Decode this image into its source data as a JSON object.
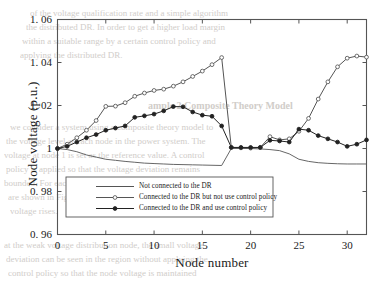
{
  "figure": {
    "background_color": "#ffffff",
    "axis_color": "#555555",
    "text_color": "#1a1a1a"
  },
  "axes": {
    "ylabel": "Node voltage (p.u.)",
    "xlabel": "Node number",
    "yticks": [
      "1. 06",
      "1. 04",
      "1. 02",
      "1",
      "0. 98",
      "0. 96"
    ],
    "ytick_values": [
      1.06,
      1.04,
      1.02,
      1.0,
      0.98,
      0.96
    ],
    "xticks": [
      "0",
      "5",
      "10",
      "15",
      "20",
      "25",
      "30"
    ],
    "xtick_values": [
      0,
      5,
      10,
      15,
      20,
      25,
      30
    ]
  },
  "legend": {
    "position": "lower-center",
    "entries": [
      {
        "label": "Not connected to the DR",
        "marker": "none",
        "color": "#555555"
      },
      {
        "label": "Connected to the DR but not use control policy",
        "marker": "open-circle",
        "color": "#555555"
      },
      {
        "label": "Connected to the DR and use control policy",
        "marker": "filled-circle",
        "color": "#222222"
      }
    ]
  },
  "chart_data": {
    "type": "line",
    "title": "",
    "xlabel": "Node number",
    "ylabel": "Node voltage (p.u.)",
    "xlim": [
      0,
      32
    ],
    "ylim": [
      0.96,
      1.06
    ],
    "grid": false,
    "legend_position": "lower-center",
    "x": [
      0,
      1,
      2,
      3,
      4,
      5,
      6,
      7,
      8,
      9,
      10,
      11,
      12,
      13,
      14,
      15,
      16,
      17,
      18,
      19,
      20,
      21,
      22,
      23,
      24,
      25,
      26,
      27,
      28,
      29,
      30,
      31,
      32
    ],
    "series": [
      {
        "name": "Not connected to the DR",
        "marker": "none",
        "color": "#555555",
        "values": [
          1.0,
          0.9995,
          0.9985,
          0.997,
          0.996,
          0.995,
          0.9945,
          0.994,
          0.9936,
          0.9932,
          0.993,
          0.9928,
          0.9926,
          0.9925,
          0.9924,
          0.9923,
          0.9922,
          0.9921,
          1.0,
          1.0,
          1.0,
          0.9998,
          0.9995,
          0.999,
          0.9975,
          0.995,
          0.994,
          0.9934,
          0.9931,
          0.9929,
          0.9928,
          0.9928,
          0.9928
        ]
      },
      {
        "name": "Connected to the DR but not use control policy",
        "marker": "open-circle",
        "color": "#555555",
        "values": [
          1.0,
          1.002,
          1.005,
          1.0085,
          1.013,
          1.0196,
          1.0197,
          1.0213,
          1.0243,
          1.0258,
          1.027,
          1.0276,
          1.029,
          1.031,
          1.0335,
          1.036,
          1.039,
          1.0423,
          1.0005,
          1.0003,
          1.0002,
          1.0005,
          1.0055,
          1.004,
          1.0045,
          1.008,
          1.014,
          1.023,
          1.031,
          1.038,
          1.042,
          1.043,
          1.0425
        ]
      },
      {
        "name": "Connected to the DR and use control policy",
        "marker": "filled-circle",
        "color": "#222222",
        "values": [
          1.0,
          1.001,
          1.003,
          1.005,
          1.0065,
          1.0085,
          1.0095,
          1.0105,
          1.0145,
          1.0152,
          1.016,
          1.0175,
          1.0195,
          1.0194,
          1.017,
          1.0155,
          1.015,
          1.0105,
          1.0005,
          1.0005,
          1.0005,
          1.0005,
          1.0038,
          1.0035,
          1.003,
          1.009,
          1.0085,
          1.006,
          1.0045,
          1.003,
          1.001,
          1.002,
          1.004
        ]
      }
    ]
  },
  "ghost_text": {
    "lines": [
      {
        "text": "of the voltage qualification rate and a simple algorithm",
        "x": 30,
        "y": 8,
        "size": 9
      },
      {
        "text": "the distributed DR. In order to get a higher load margin",
        "x": 26,
        "y": 22,
        "size": 9
      },
      {
        "text": "within a suitable range by a certain control policy and",
        "x": 22,
        "y": 36,
        "size": 9
      },
      {
        "text": "applying the distributed DR.",
        "x": 20,
        "y": 50,
        "size": 9
      },
      {
        "text": "ample 2 Composite Theory Model",
        "x": 148,
        "y": 100,
        "size": 10,
        "bold": true
      },
      {
        "text": "we consider a system using a composite theory model to",
        "x": 10,
        "y": 122,
        "size": 9
      },
      {
        "text": "the voltage level at each node in the power system. The",
        "x": 6,
        "y": 136,
        "size": 9
      },
      {
        "text": "voltage at node 1 is set as the reference value. A control",
        "x": 4,
        "y": 150,
        "size": 9
      },
      {
        "text": "policy is applied so that the voltage deviation remains",
        "x": 6,
        "y": 164,
        "size": 9
      },
      {
        "text": "bounded. For each node of the test feeder, the results",
        "x": 4,
        "y": 178,
        "size": 9
      },
      {
        "text": "are shown in Fig. 3. It can be seen that when the",
        "x": 8,
        "y": 192,
        "size": 9
      },
      {
        "text": "voltage rises.",
        "x": 10,
        "y": 206,
        "size": 9
      },
      {
        "text": "at the weak voltage distribution node, the small voltage",
        "x": 4,
        "y": 240,
        "size": 9
      },
      {
        "text": "deviation can be seen in the region without applying the",
        "x": 6,
        "y": 254,
        "size": 9
      },
      {
        "text": "control policy so that the node voltage is maintained",
        "x": 8,
        "y": 268,
        "size": 9
      }
    ]
  }
}
